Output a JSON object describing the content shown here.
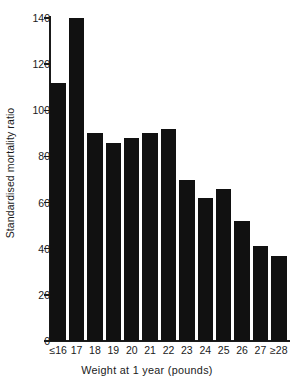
{
  "chart_data": {
    "type": "bar",
    "title": "",
    "subtitle": "",
    "xlabel": "Weight at 1 year (pounds)",
    "ylabel": "Standardised mortality ratio",
    "categories": [
      "≤16",
      "17",
      "18",
      "19",
      "20",
      "21",
      "22",
      "23",
      "24",
      "25",
      "26",
      "27",
      "≥28"
    ],
    "values": [
      112,
      140,
      90,
      86,
      88,
      90,
      92,
      70,
      62,
      66,
      52,
      41,
      37
    ],
    "ylim": [
      0,
      140
    ],
    "yticks": [
      0,
      20,
      40,
      60,
      80,
      100,
      120,
      140
    ],
    "ytick_labels": [
      "0",
      "20",
      "40",
      "60",
      "80",
      "100",
      "120",
      "140"
    ],
    "grid": false,
    "legend": null,
    "legend_position": "none",
    "bar_color": "#111111",
    "axis_color": "#1a1a1a",
    "background_color": "#ffffff"
  }
}
